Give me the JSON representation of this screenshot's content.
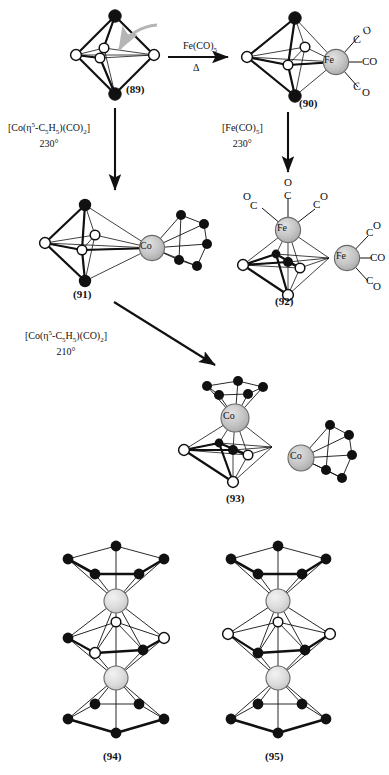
{
  "figure": {
    "type": "chemical-reaction-scheme",
    "background": "#ffffff",
    "colors": {
      "vertex_dark": "#111111",
      "vertex_open": "#ffffff",
      "metal_sphere_fe": "#c3c3c3",
      "metal_sphere_co": "#c3c3c3",
      "metal_sphere_light": "#dedede",
      "bond": "#1a1a1a",
      "hint_arrow": "#b5b5b5"
    }
  },
  "structures": [
    {
      "id": "s89",
      "caption": "(89)",
      "metals": [],
      "ligands": []
    },
    {
      "id": "s90",
      "caption": "(90)",
      "metals": [
        "Fe"
      ],
      "ligands": [
        "CO",
        "CO",
        "CO"
      ]
    },
    {
      "id": "s91",
      "caption": "(91)",
      "metals": [
        "Co"
      ],
      "ligands": [
        "C5H5"
      ]
    },
    {
      "id": "s92",
      "caption": "(92)",
      "metals": [
        "Fe",
        "Fe"
      ],
      "ligands": [
        "CO",
        "CO",
        "CO",
        "CO",
        "CO",
        "CO"
      ]
    },
    {
      "id": "s93",
      "caption": "(93)",
      "metals": [
        "Co",
        "Co"
      ],
      "ligands": [
        "C5H5",
        "C5H5"
      ]
    },
    {
      "id": "s94",
      "caption": "(94)",
      "metals": [
        "M",
        "M"
      ],
      "ligands": [
        "C5H5",
        "C5H5"
      ]
    },
    {
      "id": "s95",
      "caption": "(95)",
      "metals": [
        "M",
        "M"
      ],
      "ligands": [
        "C5H5",
        "C5H5"
      ]
    }
  ],
  "arrows": [
    {
      "id": "a1",
      "direction": "right",
      "from": "(89)",
      "to": "(90)",
      "reagent_html": "Fe(CO)<sub>5</sub>",
      "condition": "Δ"
    },
    {
      "id": "a2",
      "direction": "down",
      "from": "(89)",
      "to": "(91)",
      "reagent_html": "[Co(η<sup>5</sup>-C<sub>5</sub>H<sub>5</sub>)(CO)<sub>2</sub>]",
      "condition": "230°"
    },
    {
      "id": "a3",
      "direction": "down",
      "from": "(90)",
      "to": "(92)",
      "reagent_html": "[Fe(CO)<sub>5</sub>]",
      "condition": "230°"
    },
    {
      "id": "a4",
      "direction": "diagonal-down-right",
      "from": "(91)",
      "to": "(93)",
      "reagent_html": "[Co(η<sup>5</sup>-C<sub>5</sub>H<sub>5</sub>)(CO)<sub>2</sub>]",
      "condition": "210°"
    }
  ],
  "metal_labels": {
    "fe": "Fe",
    "co": "Co"
  },
  "co_ligand_label": "CO",
  "co_split": {
    "c": "C",
    "o": "O"
  },
  "captions": {
    "c89": "(89)",
    "c90": "(90)",
    "c91": "(91)",
    "c92": "(92)",
    "c93": "(93)",
    "c94": "(94)",
    "c95": "(95)"
  }
}
